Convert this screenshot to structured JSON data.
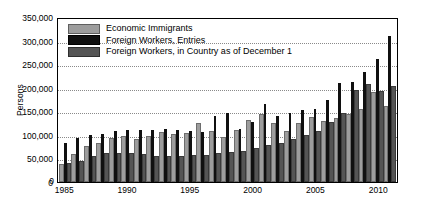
{
  "chart_data": {
    "type": "bar",
    "title": "",
    "xlabel": "",
    "ylabel": "Persons",
    "ylim": [
      0,
      350000
    ],
    "ytick_labels": [
      "0",
      "50,000",
      "100,000",
      "150,000",
      "200,000",
      "250,000",
      "300,000",
      "350,000"
    ],
    "ytick_values": [
      0,
      50000,
      100000,
      150000,
      200000,
      250000,
      300000,
      350000
    ],
    "xtick_labels": [
      "1985",
      "1990",
      "1995",
      "2000",
      "2005",
      "2010"
    ],
    "xtick_values": [
      1985,
      1990,
      1995,
      2000,
      2005,
      2010
    ],
    "grid": "horizontal-dotted",
    "legend_position": "top-left",
    "categories": [
      1985,
      1986,
      1987,
      1988,
      1989,
      1990,
      1991,
      1992,
      1993,
      1994,
      1995,
      1996,
      1997,
      1998,
      1999,
      2000,
      2001,
      2002,
      2003,
      2004,
      2005,
      2006,
      2007,
      2008,
      2009,
      2010,
      2011
    ],
    "series": [
      {
        "name": "Economic Immigrants",
        "color": "#9d9d9d",
        "values": [
          33000,
          55000,
          73000,
          78000,
          90000,
          94000,
          87000,
          94000,
          102000,
          98000,
          100000,
          120000,
          104000,
          92000,
          106000,
          128000,
          141000,
          122000,
          104000,
          121000,
          133000,
          125000,
          131000,
          141000,
          150000,
          187000,
          157000
        ]
      },
      {
        "name": "Foreign Workers, Entries",
        "color": "#101010",
        "values": [
          82000,
          93000,
          100000,
          102000,
          108000,
          110000,
          110000,
          110000,
          112000,
          110000,
          108000,
          107000,
          140000,
          146000,
          112000,
          127000,
          166000,
          140000,
          147000,
          153000,
          155000,
          174000,
          210000,
          213000,
          233000,
          260000,
          310000
        ]
      },
      {
        "name": "Foreign Workers, in Country as of December 1",
        "color": "#555555",
        "values": [
          37000,
          41000,
          52000,
          58000,
          57000,
          58000,
          55000,
          52000,
          50000,
          52000,
          53000,
          54000,
          58000,
          59000,
          62000,
          68000,
          75000,
          79000,
          88000,
          95000,
          103000,
          123000,
          143000,
          190000,
          203000,
          189000,
          200000
        ]
      }
    ]
  }
}
